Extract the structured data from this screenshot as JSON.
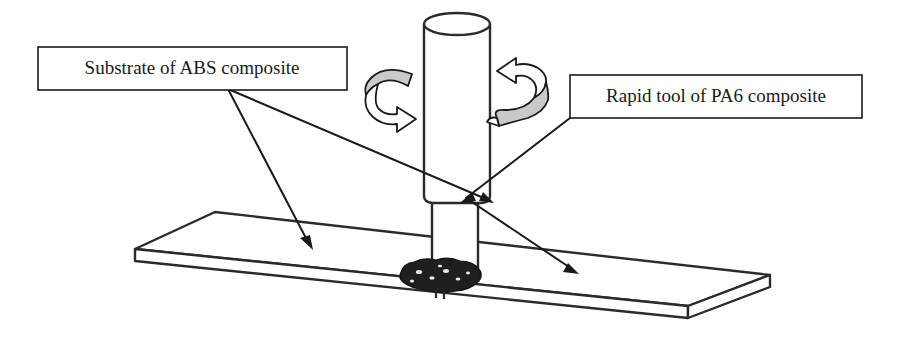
{
  "figure": {
    "kind": "technical-line-diagram",
    "background_color": "#ffffff",
    "line_color": "#2b2b2b",
    "accent_gray": "#c9c9c9",
    "weld_color": "#1f1f1f"
  },
  "callouts": [
    {
      "id": "substrate",
      "label": "Substrate of ABS composite",
      "box": {
        "x": 38,
        "y": 47,
        "width": 309,
        "height": 43
      },
      "text_anchor": {
        "x": 192,
        "y": 69
      },
      "leader_origin": {
        "x": 228,
        "y": 89
      },
      "targets": [
        {
          "x": 313,
          "y": 248
        },
        {
          "x": 492,
          "y": 203
        }
      ]
    },
    {
      "id": "rapid-tool",
      "label": "Rapid tool of PA6 composite",
      "box": {
        "x": 570,
        "y": 75,
        "width": 292,
        "height": 43
      },
      "text_anchor": {
        "x": 716,
        "y": 97
      },
      "leader_origin": {
        "x": 570,
        "y": 118
      },
      "targets": [
        {
          "x": 576,
          "y": 273
        }
      ]
    }
  ],
  "parts": {
    "substrate_plate": {
      "name": "ABS composite substrate plate",
      "top_face": "215,212 770,275 688,306 135,249",
      "front_face": "135,249 688,306 688,318 135,261",
      "right_face": "688,306 770,275 770,287 688,318"
    },
    "tool_barrel": {
      "name": "rapid tool upper cylinder",
      "left": 424,
      "right": 490,
      "top": 13,
      "bottom": 200,
      "cap_rx": 33,
      "cap_ry": 11
    },
    "tool_shank": {
      "name": "rapid tool lower shaft",
      "left": 432,
      "right": 478,
      "top": 200,
      "bottom": 282
    },
    "weld_zone": {
      "name": "friction stir weld nugget",
      "cx": 440,
      "cy": 277,
      "rx": 42,
      "ry": 14
    }
  },
  "rotation_arrows": [
    {
      "id": "rotation-arrow-left",
      "direction": "clockwise",
      "x": 362,
      "y": 64
    },
    {
      "id": "rotation-arrow-right",
      "direction": "counter-clockwise",
      "x": 494,
      "y": 60
    }
  ]
}
